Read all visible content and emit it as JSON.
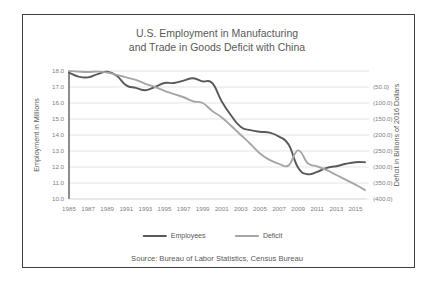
{
  "figure": {
    "source_note": "Source:  Bureau of Labor Statistics, Census Bureau",
    "border_color": "#3f3f3f",
    "background": "#ffffff"
  },
  "chart_data": {
    "type": "line",
    "title": "U.S. Employment in Manufacturing",
    "title_line2": "and Trade in Goods Deficit with China",
    "subtitle": "",
    "xlabel": "",
    "ylabel": "Employment in Millions",
    "y2label": "Deficit in Billions of 2016 Dollars",
    "grid": true,
    "legend_position": "bottom",
    "ylim": [
      10.0,
      18.0
    ],
    "y2lim": [
      -400.0,
      0.0
    ],
    "ytick_labels": [
      "18.0",
      "17.0",
      "16.0",
      "15.0",
      "14.0",
      "13.0",
      "12.0",
      "11.0",
      "10.0"
    ],
    "ytick_values": [
      18.0,
      17.0,
      16.0,
      15.0,
      14.0,
      13.0,
      12.0,
      11.0,
      10.0
    ],
    "y2tick_labels": [
      "",
      "(50.0)",
      "(100.0)",
      "(150.0)",
      "(200.0)",
      "(250.0)",
      "(300.0)",
      "(350.0)",
      "(400.0)"
    ],
    "y2tick_values": [
      0.0,
      -50.0,
      -100.0,
      -150.0,
      -200.0,
      -250.0,
      -300.0,
      -350.0,
      -400.0
    ],
    "xtick_labels": [
      "1985",
      "1987",
      "1989",
      "1991",
      "1993",
      "1995",
      "1997",
      "1999",
      "2001",
      "2003",
      "2005",
      "2007",
      "2009",
      "2011",
      "2013",
      "2015"
    ],
    "x": [
      1985,
      1986,
      1987,
      1988,
      1989,
      1990,
      1991,
      1992,
      1993,
      1994,
      1995,
      1996,
      1997,
      1998,
      1999,
      2000,
      2001,
      2002,
      2003,
      2004,
      2005,
      2006,
      2007,
      2008,
      2009,
      2010,
      2011,
      2012,
      2013,
      2014,
      2015,
      2016
    ],
    "xlim": [
      1985,
      2016
    ],
    "series": [
      {
        "name": "Employees",
        "color": "#595959",
        "axis": "left",
        "width": 1.9,
        "values": [
          17.9,
          17.65,
          17.6,
          17.8,
          17.95,
          17.7,
          17.1,
          16.95,
          16.8,
          17.0,
          17.25,
          17.25,
          17.4,
          17.55,
          17.35,
          17.25,
          16.1,
          15.2,
          14.5,
          14.3,
          14.2,
          14.15,
          13.9,
          13.4,
          11.95,
          11.55,
          11.7,
          11.95,
          12.05,
          12.2,
          12.3,
          12.3
        ]
      },
      {
        "name": "Deficit",
        "color": "#a6a6a6",
        "axis": "right",
        "width": 1.9,
        "values": [
          0.0,
          -2.0,
          -3.0,
          -2.0,
          -5.0,
          -12.0,
          -20.0,
          -28.0,
          -40.0,
          -50.0,
          -62.0,
          -72.0,
          -82.0,
          -95.0,
          -100.0,
          -125.0,
          -145.0,
          -172.0,
          -200.0,
          -228.0,
          -258.0,
          -278.0,
          -290.0,
          -295.0,
          -248.0,
          -288.0,
          -298.0,
          -310.0,
          -325.0,
          -340.0,
          -355.0,
          -372.0
        ]
      }
    ]
  }
}
